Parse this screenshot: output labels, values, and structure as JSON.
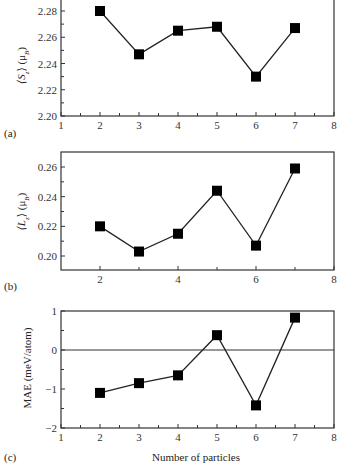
{
  "chart_data": [
    {
      "type": "line",
      "panel": "(a)",
      "ylabel": "⟨S_z⟩ (μB)",
      "xlabel": "",
      "x": [
        2,
        3,
        4,
        5,
        6,
        7
      ],
      "values": [
        2.28,
        2.247,
        2.265,
        2.268,
        2.23,
        2.267
      ],
      "xlim": [
        1,
        8
      ],
      "ylim": [
        2.2,
        2.29
      ],
      "xticks": [
        "1",
        "2",
        "3",
        "4",
        "5",
        "6",
        "7",
        "8"
      ],
      "yticks": [
        "2.20",
        "2.22",
        "2.24",
        "2.26",
        "2.28"
      ],
      "marker": "square",
      "grid": false
    },
    {
      "type": "line",
      "panel": "(b)",
      "ylabel": "⟨L_z⟩ (μB)",
      "xlabel": "",
      "x": [
        2,
        3,
        4,
        5,
        6,
        7
      ],
      "values": [
        0.22,
        0.203,
        0.215,
        0.244,
        0.207,
        0.259
      ],
      "xlim": [
        1,
        8
      ],
      "ylim": [
        0.19,
        0.27
      ],
      "xticks": [
        "2",
        "4",
        "6",
        "8"
      ],
      "yticks": [
        "0.20",
        "0.22",
        "0.24",
        "0.26"
      ],
      "marker": "square",
      "grid": false
    },
    {
      "type": "line",
      "panel": "(c)",
      "ylabel": "MAE (meV/atom)",
      "xlabel": "Number of particles",
      "x": [
        2,
        3,
        4,
        5,
        6,
        7
      ],
      "values": [
        -1.1,
        -0.85,
        -0.65,
        0.38,
        -1.42,
        0.83
      ],
      "xlim": [
        1,
        8
      ],
      "ylim": [
        -2,
        1
      ],
      "xticks": [
        "1",
        "2",
        "3",
        "4",
        "5",
        "6",
        "7",
        "8"
      ],
      "yticks": [
        "−2",
        "−1",
        "0",
        "1"
      ],
      "hline": 0,
      "marker": "square",
      "grid": false
    }
  ],
  "labels": {
    "a": "(a)",
    "b": "(b)",
    "c": "(c)",
    "ya_main": "⟨S",
    "ya_sub": "z",
    "ya_unit": "⟩ (μ",
    "ya_unit_sub": "B",
    "ya_close": ")",
    "yb_main": "⟨L",
    "yb_sub": "z",
    "yb_unit": "⟩ (μ",
    "yb_unit_sub": "B",
    "yb_close": ")",
    "yc": "MAE (meV/atom)",
    "xc": "Number of particles"
  }
}
